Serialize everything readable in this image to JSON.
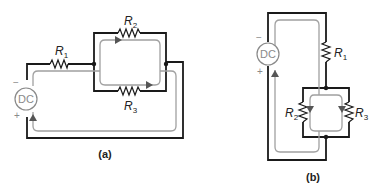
{
  "figure": {
    "panel_a": {
      "caption": "(a)",
      "source": {
        "label": "DC",
        "neg": "−",
        "pos": "+"
      },
      "resistors": [
        {
          "name": "R",
          "sub": "1"
        },
        {
          "name": "R",
          "sub": "2"
        },
        {
          "name": "R",
          "sub": "3"
        }
      ]
    },
    "panel_b": {
      "caption": "(b)",
      "source": {
        "label": "DC",
        "neg": "−",
        "pos": "+"
      },
      "resistors": [
        {
          "name": "R",
          "sub": "1"
        },
        {
          "name": "R",
          "sub": "2"
        },
        {
          "name": "R",
          "sub": "3"
        }
      ]
    }
  }
}
